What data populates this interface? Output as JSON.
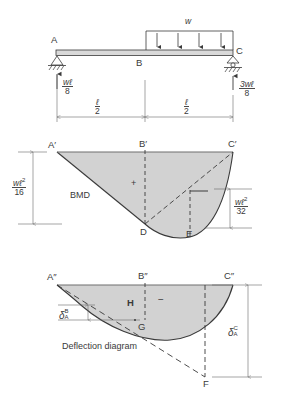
{
  "figure": {
    "background": "#ffffff",
    "line_color": "#3a3a3a",
    "fill_color": "#d2d2d2",
    "beam_fill": "#d9d9d9"
  },
  "panel_beam": {
    "name": "beam-loading-diagram",
    "points": {
      "left": "A",
      "mid": "B",
      "right": "C"
    },
    "load_label": "w",
    "arrow_count": 4,
    "reaction_left": {
      "num": "wℓ",
      "den": "8"
    },
    "reaction_right": {
      "num": "3wℓ",
      "den": "8"
    },
    "span_left": {
      "num": "ℓ",
      "den": "2"
    },
    "span_right": {
      "num": "ℓ",
      "den": "2"
    },
    "support_left": "pin-support",
    "support_right": "roller-support"
  },
  "panel_bmd": {
    "name": "bending-moment-diagram",
    "label": "BMD",
    "sign": "+",
    "points": {
      "left": "A′",
      "mid": "B′",
      "right": "C′",
      "bottom_mid": "D",
      "bottom_right": "E"
    },
    "dim_left": {
      "num": "wℓ",
      "sup": "2",
      "den": "16"
    },
    "dim_right": {
      "num": "wℓ",
      "sup": "2",
      "den": "32"
    }
  },
  "panel_deflection": {
    "name": "deflection-diagram",
    "caption": "Deflection diagram",
    "sign": "−",
    "points": {
      "left": "A″",
      "mid": "B″",
      "right": "C″",
      "tangent_mid": "H",
      "tangent_low": "G",
      "tangent_end": "F"
    },
    "delta_b": {
      "sym": "δ",
      "sup": "B",
      "sub": "A"
    },
    "delta_c": {
      "sym": "δ",
      "sup": "C",
      "sub": "A"
    }
  }
}
